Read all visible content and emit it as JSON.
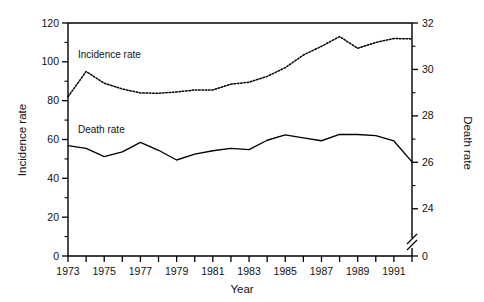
{
  "chart_data": {
    "type": "line",
    "title": "",
    "xlabel": "Year",
    "ylabel": "Incidence rate",
    "y2label": "Death rate",
    "grid": false,
    "legend_position": "inline-annotation",
    "x": [
      1973,
      1974,
      1975,
      1976,
      1977,
      1978,
      1979,
      1980,
      1981,
      1982,
      1983,
      1984,
      1985,
      1986,
      1987,
      1988,
      1989,
      1990,
      1991,
      1992
    ],
    "xlim": [
      1973,
      1992
    ],
    "xticks": [
      1973,
      1974,
      1975,
      1976,
      1977,
      1978,
      1979,
      1980,
      1981,
      1982,
      1983,
      1984,
      1985,
      1986,
      1987,
      1988,
      1989,
      1990,
      1991,
      1992
    ],
    "xtick_labels": [
      "1973",
      "",
      "1975",
      "",
      "1977",
      "",
      "1979",
      "",
      "1981",
      "",
      "1983",
      "",
      "1985",
      "",
      "1987",
      "",
      "1989",
      "",
      "1991",
      ""
    ],
    "ylim": [
      0,
      120
    ],
    "yticks": [
      0,
      20,
      40,
      60,
      80,
      100,
      120
    ],
    "ytick_labels": [
      "0",
      "20",
      "40",
      "60",
      "80",
      "100",
      "120"
    ],
    "yminor_step": 10,
    "y2lim": [
      23,
      32
    ],
    "y2ticks": [
      24,
      26,
      28,
      30,
      32
    ],
    "y2tick_labels": [
      "24",
      "26",
      "28",
      "30",
      "32"
    ],
    "y2minor": [
      25,
      27,
      29,
      31
    ],
    "y2_axis_break": true,
    "y2_break_label": "0",
    "series": [
      {
        "name": "Incidence rate",
        "axis": "left",
        "style": "dotted",
        "annotation": "Incidence rate",
        "values": [
          82.0,
          95.0,
          89.0,
          86.0,
          84.0,
          83.8,
          84.5,
          85.5,
          85.5,
          88.5,
          89.5,
          92.5,
          97.0,
          103.5,
          108.0,
          113.0,
          107.0,
          110.0,
          112.0,
          111.8
        ]
      },
      {
        "name": "Death rate",
        "axis": "right",
        "style": "solid",
        "annotation": "Death rate",
        "values": [
          26.72,
          26.6,
          26.25,
          26.45,
          26.86,
          26.52,
          26.1,
          26.35,
          26.5,
          26.6,
          26.55,
          26.95,
          27.18,
          27.05,
          26.93,
          27.2,
          27.2,
          27.15,
          26.92,
          26.02
        ]
      }
    ]
  },
  "annotations": {
    "incidence_label": "Incidence rate",
    "death_label": "Death rate"
  },
  "axes": {
    "x_title": "Year",
    "y_left_title": "Incidence rate",
    "y_right_title": "Death rate"
  }
}
